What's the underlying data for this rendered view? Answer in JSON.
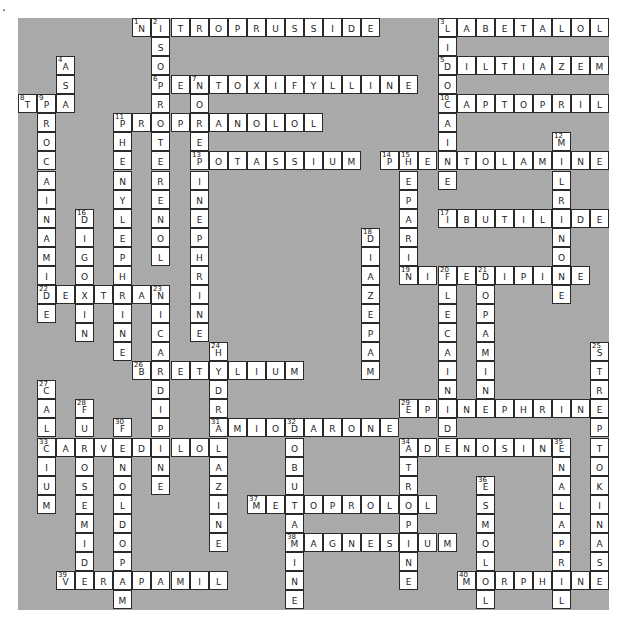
{
  "page": {
    "bullet": "."
  },
  "colors": {
    "board": "#a9a9a9",
    "cell": "#ffffff",
    "border": "#2a2a2a"
  },
  "grid": {
    "cols": 31,
    "rows": 31,
    "cell_px": 19.07,
    "origin_px": [
      18,
      18
    ]
  },
  "words": [
    {
      "num": 1,
      "dir": "across",
      "row": 0,
      "col": 6,
      "answer": "NITROPRUSSIDE"
    },
    {
      "num": 2,
      "dir": "down",
      "row": 0,
      "col": 7,
      "answer": "ISOPROTERENOL"
    },
    {
      "num": 3,
      "dir": "across",
      "row": 0,
      "col": 22,
      "answer": "LABETALOL"
    },
    {
      "num": 3,
      "dir": "down",
      "row": 0,
      "col": 22,
      "answer": "LIDOCAINE"
    },
    {
      "num": 4,
      "dir": "down",
      "row": 2,
      "col": 2,
      "answer": "ASA"
    },
    {
      "num": 5,
      "dir": "across",
      "row": 2,
      "col": 22,
      "answer": "DILTIAZEM"
    },
    {
      "num": 6,
      "dir": "across",
      "row": 3,
      "col": 7,
      "answer": "PENTOXIFYLLINE"
    },
    {
      "num": 7,
      "dir": "down",
      "row": 3,
      "col": 9,
      "answer": "NOREPINEPHRINE"
    },
    {
      "num": 8,
      "dir": "across",
      "row": 4,
      "col": 0,
      "answer": "TPA"
    },
    {
      "num": 9,
      "dir": "down",
      "row": 4,
      "col": 1,
      "answer": "PROCAINAMIDE"
    },
    {
      "num": 10,
      "dir": "across",
      "row": 4,
      "col": 22,
      "answer": "CAPTOPRIL"
    },
    {
      "num": 11,
      "dir": "across",
      "row": 5,
      "col": 5,
      "answer": "PROPRANOLOL"
    },
    {
      "num": 11,
      "dir": "down",
      "row": 5,
      "col": 5,
      "answer": "PHENYLEPHRINE"
    },
    {
      "num": 12,
      "dir": "down",
      "row": 6,
      "col": 28,
      "answer": "MILRINONE"
    },
    {
      "num": 13,
      "dir": "across",
      "row": 7,
      "col": 9,
      "answer": "POTASSIUM"
    },
    {
      "num": 14,
      "dir": "across",
      "row": 7,
      "col": 19,
      "answer": "PHENTOLAMINE"
    },
    {
      "num": 15,
      "dir": "down",
      "row": 7,
      "col": 20,
      "answer": "HEPARIN"
    },
    {
      "num": 16,
      "dir": "down",
      "row": 10,
      "col": 3,
      "answer": "DIGOXIN"
    },
    {
      "num": 17,
      "dir": "across",
      "row": 10,
      "col": 22,
      "answer": "IBUTILIDE"
    },
    {
      "num": 18,
      "dir": "down",
      "row": 11,
      "col": 18,
      "answer": "DIAZEPAM"
    },
    {
      "num": 19,
      "dir": "across",
      "row": 13,
      "col": 20,
      "answer": "NIFEDIPINE"
    },
    {
      "num": 20,
      "dir": "down",
      "row": 13,
      "col": 22,
      "answer": "FLECAINIDE"
    },
    {
      "num": 21,
      "dir": "down",
      "row": 13,
      "col": 24,
      "answer": "DOPAMINE"
    },
    {
      "num": 22,
      "dir": "across",
      "row": 14,
      "col": 1,
      "answer": "DEXTRAN"
    },
    {
      "num": 23,
      "dir": "down",
      "row": 14,
      "col": 7,
      "answer": "NICARDIPINE"
    },
    {
      "num": 24,
      "dir": "down",
      "row": 17,
      "col": 10,
      "answer": "HYDRALAZINE"
    },
    {
      "num": 25,
      "dir": "down",
      "row": 17,
      "col": 30,
      "answer": "STREPTOKINASE"
    },
    {
      "num": 26,
      "dir": "across",
      "row": 18,
      "col": 6,
      "answer": "BRETYLIUM"
    },
    {
      "num": 27,
      "dir": "down",
      "row": 19,
      "col": 1,
      "answer": "CALCIUM"
    },
    {
      "num": 28,
      "dir": "down",
      "row": 20,
      "col": 3,
      "answer": "FUROSEMIDE"
    },
    {
      "num": 29,
      "dir": "across",
      "row": 20,
      "col": 20,
      "answer": "EPINEPHRINE"
    },
    {
      "num": 30,
      "dir": "down",
      "row": 21,
      "col": 5,
      "answer": "FENOLDOPAM"
    },
    {
      "num": 31,
      "dir": "across",
      "row": 21,
      "col": 10,
      "answer": "AMIODARONE"
    },
    {
      "num": 32,
      "dir": "down",
      "row": 21,
      "col": 14,
      "answer": "DOBUTAMINE"
    },
    {
      "num": 33,
      "dir": "across",
      "row": 22,
      "col": 1,
      "answer": "CARVEDILOL"
    },
    {
      "num": 34,
      "dir": "across",
      "row": 22,
      "col": 20,
      "answer": "ADENOSINE"
    },
    {
      "num": 34,
      "dir": "down",
      "row": 22,
      "col": 20,
      "answer": "ATROPINE"
    },
    {
      "num": 35,
      "dir": "down",
      "row": 22,
      "col": 28,
      "answer": "ENALAPRIL"
    },
    {
      "num": 36,
      "dir": "down",
      "row": 24,
      "col": 24,
      "answer": "ESMOLOL"
    },
    {
      "num": 37,
      "dir": "across",
      "row": 25,
      "col": 12,
      "answer": "METOPROLOL"
    },
    {
      "num": 38,
      "dir": "across",
      "row": 27,
      "col": 14,
      "answer": "MAGNESIUM"
    },
    {
      "num": 39,
      "dir": "across",
      "row": 29,
      "col": 2,
      "answer": "VERAPAMIL"
    },
    {
      "num": 40,
      "dir": "across",
      "row": 29,
      "col": 23,
      "answer": "MORPHINE"
    }
  ]
}
